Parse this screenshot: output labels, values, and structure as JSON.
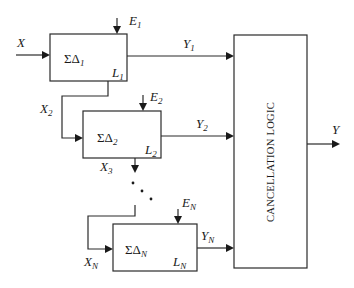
{
  "diagram": {
    "input": {
      "label": "X"
    },
    "output": {
      "label": "Y"
    },
    "cancellation_block": {
      "label": "CANCELLATION LOGIC"
    },
    "modulators": [
      {
        "name": "ΣΔ",
        "index": "1",
        "error_label": "E",
        "error_sub": "1",
        "out_label": "Y",
        "out_sub": "1",
        "level_label": "L",
        "level_sub": "1"
      },
      {
        "name": "ΣΔ",
        "index": "2",
        "error_label": "E",
        "error_sub": "2",
        "out_label": "Y",
        "out_sub": "2",
        "level_label": "L",
        "level_sub": "2",
        "in_label": "X",
        "in_sub": "2"
      },
      {
        "name": "ΣΔ",
        "index": "N",
        "error_label": "E",
        "error_sub": "N",
        "out_label": "Y",
        "out_sub": "N",
        "level_label": "L",
        "level_sub": "N",
        "in_label": "X",
        "in_sub": "N"
      }
    ],
    "x3": {
      "label": "X",
      "sub": "3"
    },
    "ellipsis": "continuation dots"
  }
}
